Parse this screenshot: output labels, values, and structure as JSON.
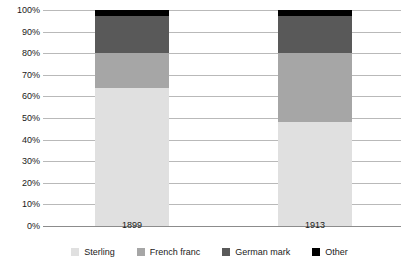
{
  "chart_data": {
    "type": "bar",
    "subtype": "stacked-100-percent",
    "title": "",
    "subtitle": "",
    "xlabel": "",
    "ylabel": "",
    "categories": [
      "1899",
      "1913"
    ],
    "series": [
      {
        "name": "Sterling",
        "color": "#e0e0e0",
        "values": [
          64,
          48
        ]
      },
      {
        "name": "French franc",
        "color": "#a6a6a6",
        "values": [
          16,
          32
        ]
      },
      {
        "name": "German mark",
        "color": "#595959",
        "values": [
          17,
          17
        ]
      },
      {
        "name": "Other",
        "color": "#000000",
        "values": [
          3,
          3
        ]
      }
    ],
    "ylim": [
      0,
      100
    ],
    "y_tick_step": 10,
    "y_ticks": [
      "100%",
      "90%",
      "80%",
      "70%",
      "60%",
      "50%",
      "40%",
      "30%",
      "20%",
      "10%",
      "0%"
    ],
    "y_tick_values": [
      100,
      90,
      80,
      70,
      60,
      50,
      40,
      30,
      20,
      10,
      0
    ],
    "grid": true,
    "grid_axis": "y",
    "legend_position": "bottom",
    "stack_tops": {
      "1899": {
        "sterling_top": 64,
        "french_franc_top": 80,
        "german_mark_top": 97,
        "other_top": 100
      },
      "1913": {
        "sterling_top": 48,
        "french_franc_top": 80,
        "german_mark_top": 97,
        "other_top": 100
      }
    }
  },
  "colors": {
    "background": "#ffffff",
    "gridline": "#b9b9b9",
    "baseline": "#8c8c8c",
    "text": "#1a1a1a",
    "sterling": "#e0e0e0",
    "french_franc": "#a6a6a6",
    "german_mark": "#595959",
    "other": "#000000"
  }
}
